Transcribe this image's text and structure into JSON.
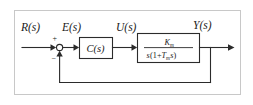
{
  "diagram": {
    "type": "control-system-block-diagram",
    "frame": {
      "border_color": "#c8c8c8",
      "background": "#ffffff"
    },
    "line_color": "#2b2b2b",
    "signals": {
      "reference": "R(s)",
      "error": "E(s)",
      "control": "U(s)",
      "output": "Y(s)"
    },
    "summing_junction": {
      "name": "summing-junction",
      "plus_sign": "+",
      "minus_sign": "−",
      "shape": "circle"
    },
    "blocks": [
      {
        "id": "controller",
        "label": "C(s)"
      },
      {
        "id": "plant",
        "numerator": "K",
        "numerator_subscript": "m",
        "denominator_parts": {
          "s_left": "s",
          "open_paren": "(",
          "one_plus": "1+",
          "T": "T",
          "T_subscript": "m",
          "s_inner": "s",
          "close_paren": ")"
        },
        "transfer_function_text": "K_m / ( s (1 + T_m s) )"
      }
    ],
    "feedback": {
      "name": "feedback-path",
      "description": "unity negative feedback from output to summing junction"
    }
  }
}
